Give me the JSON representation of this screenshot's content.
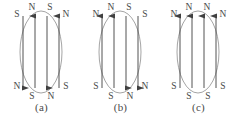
{
  "figure": {
    "background_color": "#ffffff",
    "ellipse_stroke": "#9a9a9a",
    "arrow_stroke": "#404040",
    "label_color": "#4a4a4a"
  },
  "panels": [
    {
      "id": "a",
      "caption": "(a)",
      "arrow_count": 4,
      "arrow_directions": [
        "down",
        "up",
        "down",
        "up"
      ],
      "top_labels": [
        "S",
        "N",
        "S",
        "N"
      ],
      "bottom_labels": [
        "N",
        "S",
        "N",
        "S"
      ]
    },
    {
      "id": "b",
      "caption": "(b)",
      "arrow_count": 4,
      "arrow_directions": [
        "up",
        "up",
        "down",
        "down"
      ],
      "top_labels": [
        "N",
        "N",
        "S",
        "S"
      ],
      "bottom_labels": [
        "S",
        "S",
        "N",
        "N"
      ]
    },
    {
      "id": "c",
      "caption": "(c)",
      "arrow_count": 4,
      "arrow_directions": [
        "up",
        "up",
        "up",
        "up"
      ],
      "top_labels": [
        "N",
        "N",
        "N",
        "N"
      ],
      "bottom_labels": [
        "S",
        "S",
        "S",
        "S"
      ]
    }
  ],
  "geometry": {
    "ellipse_cx": 39,
    "ellipse_cy": 52,
    "ellipse_rx": 21,
    "ellipse_ry": 41,
    "arrow_x": [
      21,
      33,
      45,
      57
    ],
    "arrow_top_y": 16,
    "arrow_bottom_y": 88,
    "top_label_y": [
      11,
      7,
      7,
      11
    ],
    "bottom_label_y": [
      93,
      98,
      98,
      93
    ]
  }
}
